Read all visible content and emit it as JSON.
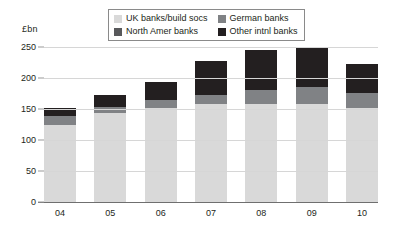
{
  "axis": {
    "unit_label": "£bn",
    "y_ticks": [
      "0",
      "50",
      "100",
      "150",
      "200",
      "250"
    ],
    "x_ticks": [
      "04",
      "05",
      "06",
      "07",
      "08",
      "09",
      "10"
    ]
  },
  "legend": {
    "items": [
      {
        "label": "UK banks/build socs",
        "color": "#d9d9d9",
        "swatch_name": "legend-swatch-uk"
      },
      {
        "label": "German banks",
        "color": "#808285",
        "swatch_name": "legend-swatch-german"
      },
      {
        "label": "North Amer banks",
        "color": "#58595b",
        "swatch_name": "legend-swatch-north-amer"
      },
      {
        "label": "Other intnl banks",
        "color": "#231f20",
        "swatch_name": "legend-swatch-other-intnl"
      }
    ]
  },
  "chart_data": {
    "type": "bar",
    "stacked": true,
    "title": "",
    "subtitle": "",
    "xlabel": "",
    "ylabel": "£bn",
    "ylim": [
      0,
      250
    ],
    "ytick_step": 50,
    "grid": true,
    "legend_position": "top-center",
    "categories": [
      "04",
      "05",
      "06",
      "07",
      "08",
      "09",
      "10"
    ],
    "series": [
      {
        "name": "UK banks/build socs",
        "color": "#d9d9d9",
        "values": [
          125,
          144,
          152,
          158,
          158,
          158,
          152
        ]
      },
      {
        "name": "German banks",
        "color": "#808285",
        "values": [
          13,
          9,
          12,
          14,
          22,
          28,
          24
        ]
      },
      {
        "name": "North Amer banks",
        "color": "#58595b",
        "values": [
          0,
          0,
          0,
          0,
          0,
          0,
          0
        ]
      },
      {
        "name": "Other intnl banks",
        "color": "#231f20",
        "values": [
          14,
          19,
          29,
          56,
          66,
          62,
          46
        ]
      }
    ],
    "totals": [
      152,
      172,
      193,
      228,
      246,
      248,
      222
    ]
  }
}
